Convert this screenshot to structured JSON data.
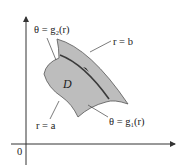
{
  "figure": {
    "region_label": "D",
    "origin_label": "0",
    "boundaries": {
      "outer": "r = b",
      "inner": "r = a",
      "upper": "θ = g₂(r)",
      "lower": "θ = g₁(r)"
    },
    "colors": {
      "region_fill": "#bdbdbd",
      "region_stroke": "#555555",
      "curve": "#3a3a3a",
      "axes": "#333333",
      "text": "#222222"
    }
  }
}
